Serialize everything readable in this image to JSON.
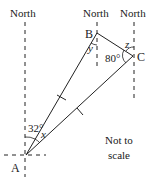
{
  "diagram": {
    "north_labels": [
      "North",
      "North",
      "North"
    ],
    "points": {
      "A": {
        "label": "A",
        "x": 26,
        "y": 155
      },
      "B": {
        "label": "B",
        "x": 97,
        "y": 33
      },
      "C": {
        "label": "C",
        "x": 133,
        "y": 56
      }
    },
    "angles": {
      "A_bearing": "32°",
      "A_between": "x",
      "B_angle": "y",
      "C_angle": "80°",
      "C_north": "z"
    },
    "note_line1": "Not to",
    "note_line2": "scale",
    "stroke_color": "#222222"
  }
}
